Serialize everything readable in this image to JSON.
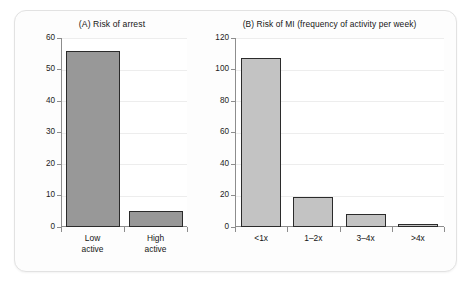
{
  "figure": {
    "background_color": "#ffffff",
    "panel_background": "#fdfdfd",
    "panel_border_color": "#e2e2e2"
  },
  "chart_data": [
    {
      "type": "bar",
      "panel": "A",
      "title": "(A) Risk of arrest",
      "xlabel": "",
      "ylabel": "",
      "categories": [
        "Low active",
        "High active"
      ],
      "values": [
        56,
        5
      ],
      "ylim": [
        0,
        60
      ],
      "yticks": [
        0,
        10,
        20,
        30,
        40,
        50,
        60
      ],
      "ytick_labels": [
        "0",
        "10",
        "20",
        "30",
        "40",
        "50",
        "60"
      ],
      "grid": true,
      "legend": "none",
      "bar_color": "#989898",
      "bar_edge_color": "#2b2b2b"
    },
    {
      "type": "bar",
      "panel": "B",
      "title": "(B) Risk of MI (frequency of activity per week)",
      "xlabel": "",
      "ylabel": "",
      "categories": [
        "<1x",
        "1–2x",
        "3–4x",
        ">4x"
      ],
      "values": [
        107,
        19,
        8.5,
        2
      ],
      "ylim": [
        0,
        120
      ],
      "yticks": [
        0,
        20,
        40,
        60,
        80,
        100,
        120
      ],
      "ytick_labels": [
        "0",
        "20",
        "40",
        "60",
        "80",
        "100",
        "120"
      ],
      "grid": true,
      "legend": "none",
      "bar_color": "#c3c3c3",
      "bar_edge_color": "#2b2b2b"
    }
  ]
}
